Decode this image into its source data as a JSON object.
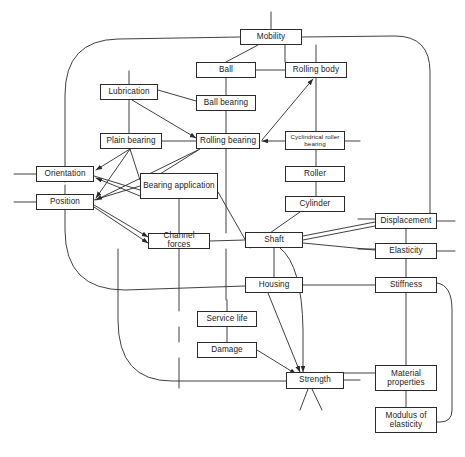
{
  "diagram": {
    "type": "network-diagram",
    "title": "",
    "style": {
      "node_fill": "#ffffff",
      "node_stroke": "#2a2a2a",
      "edge_color": "#2a2a2a",
      "background": "#ffffff"
    },
    "nodes": [
      {
        "id": "mobility",
        "label": "Mobility",
        "x": 240,
        "y": 29,
        "w": 62,
        "h": 16,
        "bold": false
      },
      {
        "id": "ball",
        "label": "Ball",
        "x": 196,
        "y": 62,
        "w": 60,
        "h": 16,
        "bold": false
      },
      {
        "id": "rolling-body",
        "label": "Rolling body",
        "x": 285,
        "y": 62,
        "w": 62,
        "h": 16,
        "bold": false
      },
      {
        "id": "lubrication",
        "label": "Lubrication",
        "x": 100,
        "y": 84,
        "w": 58,
        "h": 16,
        "bold": false
      },
      {
        "id": "ball-bearing",
        "label": "Ball bearing",
        "x": 196,
        "y": 95,
        "w": 60,
        "h": 16,
        "bold": false
      },
      {
        "id": "plain-bearing",
        "label": "Plain bearing",
        "x": 100,
        "y": 133,
        "w": 62,
        "h": 16,
        "bold": false
      },
      {
        "id": "rolling-bearing",
        "label": "Rolling bearing",
        "x": 196,
        "y": 133,
        "w": 64,
        "h": 16,
        "bold": true
      },
      {
        "id": "cyl-roller-brg",
        "label": "Cyclindrical roller bearing",
        "x": 285,
        "y": 131,
        "w": 60,
        "h": 19,
        "bold": false,
        "two_line": true
      },
      {
        "id": "roller",
        "label": "Roller",
        "x": 285,
        "y": 166,
        "w": 60,
        "h": 16,
        "bold": false
      },
      {
        "id": "cylinder",
        "label": "Cylinder",
        "x": 285,
        "y": 196,
        "w": 60,
        "h": 16,
        "bold": false
      },
      {
        "id": "orientation",
        "label": "Orientation",
        "x": 36,
        "y": 166,
        "w": 58,
        "h": 16,
        "bold": false
      },
      {
        "id": "position",
        "label": "Position",
        "x": 36,
        "y": 194,
        "w": 58,
        "h": 16,
        "bold": false
      },
      {
        "id": "bearing-app",
        "label": "Bearing application",
        "x": 140,
        "y": 173,
        "w": 78,
        "h": 26,
        "bold": true,
        "two_line": true
      },
      {
        "id": "channel-forces",
        "label": "Channel forces",
        "x": 148,
        "y": 233,
        "w": 62,
        "h": 16,
        "bold": false
      },
      {
        "id": "shaft",
        "label": "Shaft",
        "x": 245,
        "y": 232,
        "w": 58,
        "h": 16,
        "bold": true
      },
      {
        "id": "housing",
        "label": "Housing",
        "x": 245,
        "y": 277,
        "w": 58,
        "h": 16,
        "bold": true
      },
      {
        "id": "service-life",
        "label": "Service life",
        "x": 197,
        "y": 311,
        "w": 60,
        "h": 16,
        "bold": false
      },
      {
        "id": "damage",
        "label": "Damage",
        "x": 197,
        "y": 342,
        "w": 60,
        "h": 16,
        "bold": false
      },
      {
        "id": "strength",
        "label": "Strength",
        "x": 286,
        "y": 372,
        "w": 58,
        "h": 17,
        "bold": true
      },
      {
        "id": "displacement",
        "label": "Displacement",
        "x": 375,
        "y": 213,
        "w": 62,
        "h": 16,
        "bold": false
      },
      {
        "id": "elasticity",
        "label": "Elasticity",
        "x": 375,
        "y": 243,
        "w": 62,
        "h": 16,
        "bold": false
      },
      {
        "id": "stiffness",
        "label": "Stiffness",
        "x": 375,
        "y": 277,
        "w": 62,
        "h": 16,
        "bold": false
      },
      {
        "id": "material-props",
        "label": "Material properties",
        "x": 375,
        "y": 365,
        "w": 62,
        "h": 26,
        "bold": false,
        "two_line": true
      },
      {
        "id": "modulus",
        "label": "Modulus of elasticity",
        "x": 375,
        "y": 407,
        "w": 62,
        "h": 26,
        "bold": false,
        "two_line": true
      }
    ],
    "edge_count": 44
  }
}
